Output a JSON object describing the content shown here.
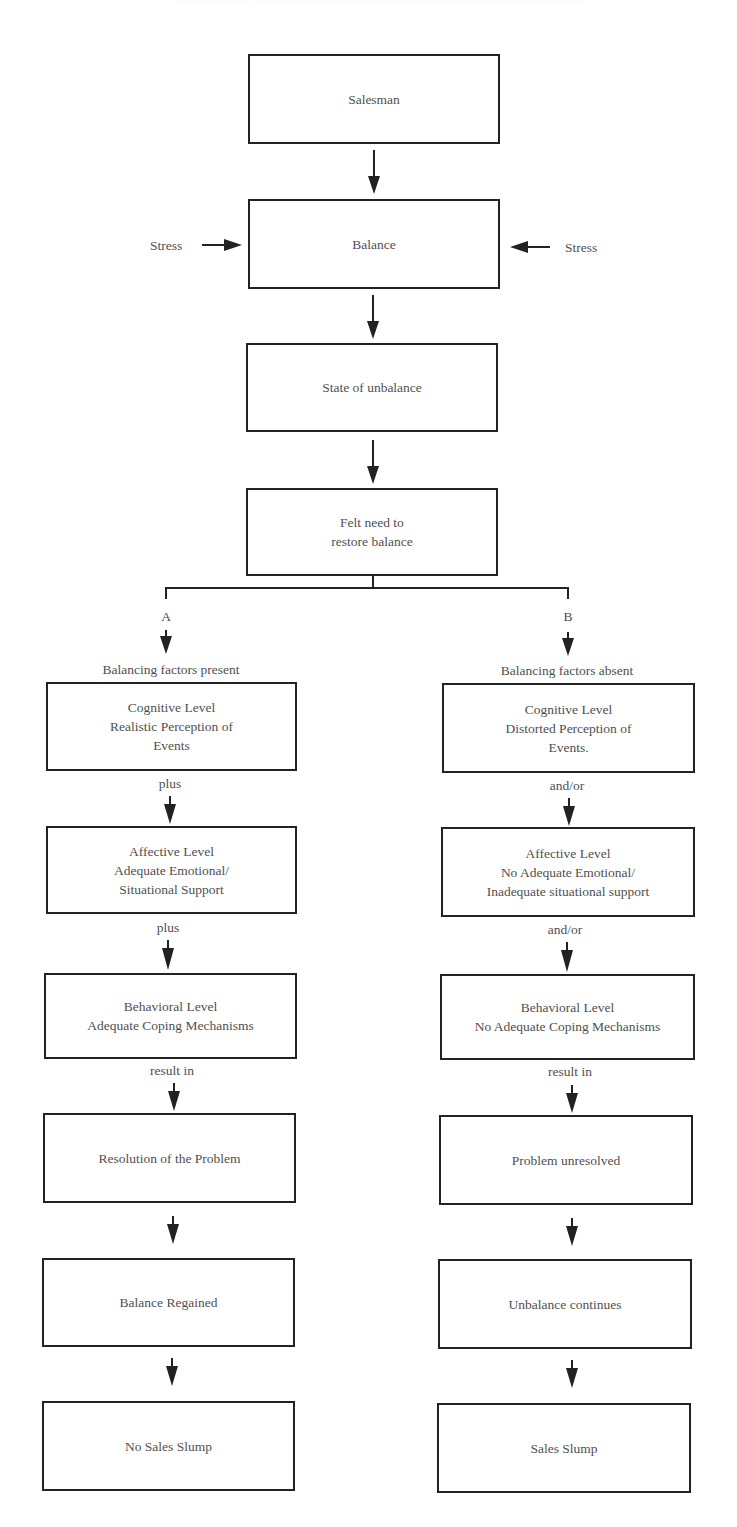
{
  "diagram": {
    "title_clipped": "",
    "top": {
      "salesman": "Salesman",
      "balance": "Balance",
      "stress_left": "Stress",
      "stress_right": "Stress",
      "state_unbalance": "State of unbalance",
      "felt_need": [
        "Felt need to",
        "restore balance"
      ]
    },
    "branch_a": {
      "letter": "A",
      "header": "Balancing factors present",
      "cognitive": [
        "Cognitive Level",
        "Realistic Perception of",
        "Events"
      ],
      "connector_1": "plus",
      "affective": [
        "Affective Level",
        "Adequate Emotional/",
        "Situational Support"
      ],
      "connector_2": "plus",
      "behavioral": [
        "Behavioral Level",
        "Adequate Coping Mechanisms"
      ],
      "connector_3": "result in",
      "resolution": "Resolution of the Problem",
      "balance_regained": "Balance Regained",
      "outcome": "No Sales Slump"
    },
    "branch_b": {
      "letter": "B",
      "header": "Balancing factors absent",
      "cognitive": [
        "Cognitive Level",
        "Distorted Perception of",
        "Events."
      ],
      "connector_1": "and/or",
      "affective": [
        "Affective Level",
        "No Adequate Emotional/",
        "Inadequate situational support"
      ],
      "connector_2": "and/or",
      "behavioral": [
        "Behavioral Level",
        "No Adequate Coping Mechanisms"
      ],
      "connector_3": "result in",
      "resolution": "Problem unresolved",
      "balance_regained": "Unbalance continues",
      "outcome": "Sales Slump"
    },
    "colors": {
      "line": "#222222",
      "text": "#505050",
      "background": "#ffffff"
    }
  }
}
